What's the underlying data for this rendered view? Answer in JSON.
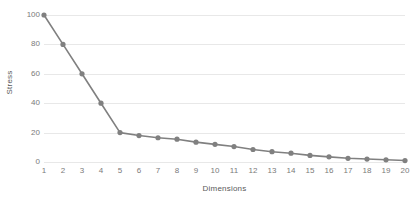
{
  "chart_data": {
    "type": "line",
    "title": "",
    "xlabel": "Dimensions",
    "ylabel": "Stress",
    "x": [
      1,
      2,
      3,
      4,
      5,
      6,
      7,
      8,
      9,
      10,
      11,
      12,
      13,
      14,
      15,
      16,
      17,
      18,
      19,
      20
    ],
    "categories": [
      "1",
      "2",
      "3",
      "4",
      "5",
      "6",
      "7",
      "8",
      "9",
      "10",
      "11",
      "12",
      "13",
      "14",
      "15",
      "16",
      "17",
      "18",
      "19",
      "20"
    ],
    "values": [
      100,
      80,
      60,
      40,
      20,
      18,
      16.5,
      15.5,
      13.5,
      12,
      10.5,
      8.5,
      7,
      6,
      4.5,
      3.5,
      2.5,
      2,
      1.5,
      1
    ],
    "series": [
      {
        "name": "Stress",
        "values": [
          100,
          80,
          60,
          40,
          20,
          18,
          16.5,
          15.5,
          13.5,
          12,
          10.5,
          8.5,
          7,
          6,
          4.5,
          3.5,
          2.5,
          2,
          1.5,
          1
        ]
      }
    ],
    "xlim": [
      1,
      20
    ],
    "ylim": [
      0,
      100
    ],
    "yticks": [
      0,
      20,
      40,
      60,
      80,
      100
    ],
    "ytick_labels": [
      "0",
      "20",
      "40",
      "60",
      "80",
      "100"
    ],
    "xticks": [
      1,
      2,
      3,
      4,
      5,
      6,
      7,
      8,
      9,
      10,
      11,
      12,
      13,
      14,
      15,
      16,
      17,
      18,
      19,
      20
    ],
    "grid": "horizontal",
    "legend": "none",
    "marker": "circle",
    "colors": {
      "series": "#808080",
      "grid": "#e8e8e8",
      "tick_text": "#7a7a7a",
      "axis_title": "#595959",
      "background": "#ffffff"
    }
  }
}
